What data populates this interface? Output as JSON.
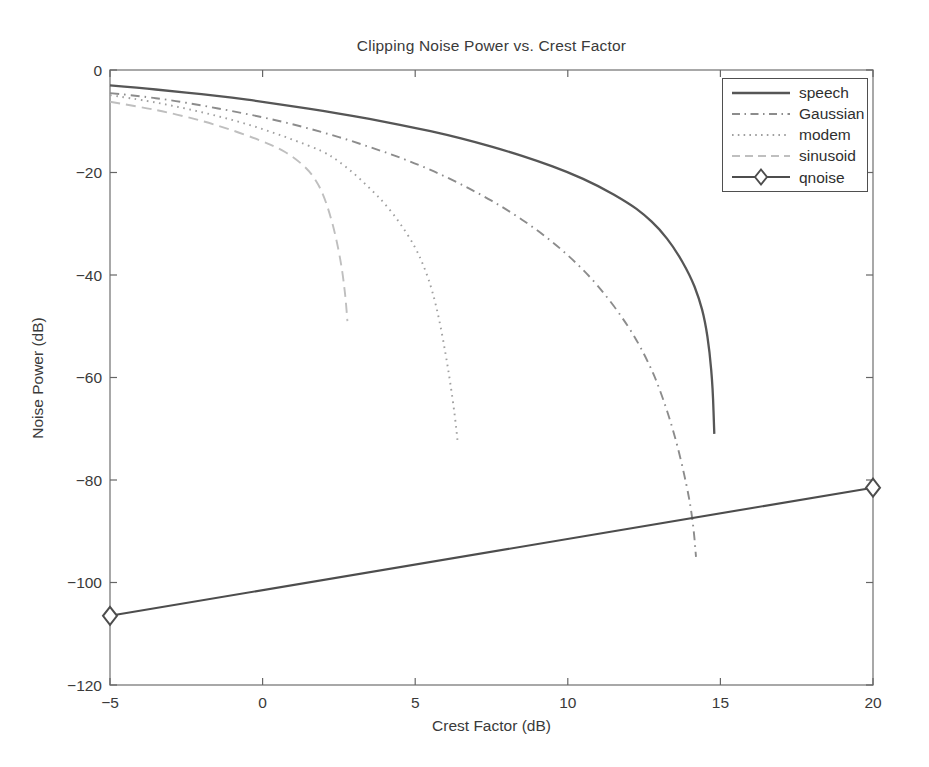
{
  "figure": {
    "background": "#ffffff",
    "frame_color": "#7a7a7a",
    "tick_color": "#666666",
    "text_color": "#3a3a3a"
  },
  "chart_data": {
    "type": "line",
    "title": "Clipping Noise Power vs. Crest Factor",
    "xlabel": "Crest Factor (dB)",
    "ylabel": "Noise Power (dB)",
    "xlim": [
      -5,
      20
    ],
    "ylim": [
      -120,
      0
    ],
    "x_ticks": [
      -5,
      0,
      5,
      10,
      15,
      20
    ],
    "y_ticks": [
      0,
      -20,
      -40,
      -60,
      -80,
      -100,
      -120
    ],
    "grid": false,
    "legend_position": "top-right",
    "series": [
      {
        "name": "speech",
        "style": "solid",
        "color": "#565656",
        "width": 2.3,
        "marker": "none",
        "points": [
          [
            -5,
            -3
          ],
          [
            -4,
            -3.5
          ],
          [
            -3,
            -4.1
          ],
          [
            -2,
            -4.7
          ],
          [
            -1,
            -5.4
          ],
          [
            0,
            -6.2
          ],
          [
            1,
            -7.1
          ],
          [
            2,
            -8
          ],
          [
            3,
            -9
          ],
          [
            4,
            -10.1
          ],
          [
            5,
            -11.3
          ],
          [
            6,
            -12.6
          ],
          [
            7,
            -14.1
          ],
          [
            8,
            -15.8
          ],
          [
            9,
            -17.7
          ],
          [
            10,
            -19.9
          ],
          [
            11,
            -22.6
          ],
          [
            12,
            -26
          ],
          [
            12.5,
            -28.2
          ],
          [
            13,
            -31
          ],
          [
            13.5,
            -34.8
          ],
          [
            14,
            -40
          ],
          [
            14.3,
            -44.5
          ],
          [
            14.5,
            -49
          ],
          [
            14.65,
            -55
          ],
          [
            14.75,
            -62
          ],
          [
            14.8,
            -71
          ]
        ]
      },
      {
        "name": "Gaussian",
        "style": "dash-dot",
        "color": "#8c8c8c",
        "width": 1.9,
        "marker": "none",
        "points": [
          [
            -5,
            -4.5
          ],
          [
            -4,
            -5.1
          ],
          [
            -3,
            -5.9
          ],
          [
            -2,
            -6.9
          ],
          [
            -1,
            -8
          ],
          [
            0,
            -9.2
          ],
          [
            1,
            -10.6
          ],
          [
            2,
            -12.2
          ],
          [
            3,
            -14
          ],
          [
            4,
            -16
          ],
          [
            5,
            -18.2
          ],
          [
            6,
            -20.8
          ],
          [
            7,
            -23.8
          ],
          [
            8,
            -27.2
          ],
          [
            9,
            -31.2
          ],
          [
            10,
            -36
          ],
          [
            11,
            -42
          ],
          [
            12,
            -50
          ],
          [
            12.6,
            -56.5
          ],
          [
            13,
            -62
          ],
          [
            13.5,
            -71
          ],
          [
            13.9,
            -81
          ],
          [
            14.1,
            -88
          ],
          [
            14.2,
            -95
          ]
        ]
      },
      {
        "name": "modem",
        "style": "dotted",
        "color": "#a0a0a0",
        "width": 1.9,
        "marker": "none",
        "points": [
          [
            -5,
            -4.9
          ],
          [
            -4,
            -5.8
          ],
          [
            -3,
            -6.9
          ],
          [
            -2,
            -8.2
          ],
          [
            -1,
            -9.7
          ],
          [
            0,
            -11.5
          ],
          [
            1,
            -13.6
          ],
          [
            2,
            -15.9
          ],
          [
            2.5,
            -17.8
          ],
          [
            3,
            -20.2
          ],
          [
            3.5,
            -23
          ],
          [
            4,
            -26
          ],
          [
            4.5,
            -29.8
          ],
          [
            5,
            -34.5
          ],
          [
            5.3,
            -38.5
          ],
          [
            5.56,
            -43
          ],
          [
            5.8,
            -49
          ],
          [
            6,
            -55.5
          ],
          [
            6.15,
            -61
          ],
          [
            6.3,
            -67.5
          ],
          [
            6.4,
            -73
          ]
        ]
      },
      {
        "name": "sinusoid",
        "style": "dashed",
        "color": "#bfbfbf",
        "width": 1.9,
        "marker": "none",
        "points": [
          [
            -5,
            -6.2
          ],
          [
            -4,
            -7.2
          ],
          [
            -3,
            -8.4
          ],
          [
            -2,
            -9.9
          ],
          [
            -1,
            -11.7
          ],
          [
            0,
            -13.9
          ],
          [
            0.5,
            -15.2
          ],
          [
            1,
            -16.9
          ],
          [
            1.5,
            -19.5
          ],
          [
            1.8,
            -22
          ],
          [
            2,
            -24.5
          ],
          [
            2.2,
            -28
          ],
          [
            2.4,
            -32.5
          ],
          [
            2.55,
            -37
          ],
          [
            2.65,
            -41
          ],
          [
            2.72,
            -44.5
          ],
          [
            2.78,
            -49
          ]
        ]
      },
      {
        "name": "qnoise",
        "style": "solid",
        "color": "#4d4d4d",
        "width": 2.1,
        "marker": "diamond",
        "points": [
          [
            -5,
            -106.5
          ],
          [
            20,
            -81.5
          ]
        ]
      }
    ]
  }
}
